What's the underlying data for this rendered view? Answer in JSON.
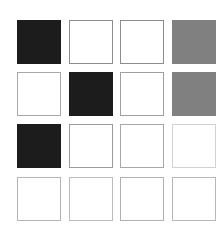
{
  "chart_data": {
    "type": "heatmap",
    "title": "",
    "subtitle": "",
    "xlabel": "",
    "ylabel": "",
    "grid": false,
    "legend": "none",
    "x_tick_labels": [],
    "y_tick_labels": [],
    "columns": 4,
    "rows": 4,
    "value_range": [
      0,
      1
    ],
    "colorscale": {
      "high": "#1c1c1c",
      "mid": "#808080",
      "low": "#ffffff"
    },
    "cells": [
      [
        {
          "value": 1.0,
          "fill": "#1c1c1c",
          "border": "#1c1c1c"
        },
        {
          "value": 0.0,
          "fill": "#ffffff",
          "border": "#8c8c8c"
        },
        {
          "value": 0.0,
          "fill": "#ffffff",
          "border": "#8c8c8c"
        },
        {
          "value": 0.5,
          "fill": "#808080",
          "border": "#808080"
        }
      ],
      [
        {
          "value": 0.0,
          "fill": "#ffffff",
          "border": "#a8a8a8"
        },
        {
          "value": 1.0,
          "fill": "#1c1c1c",
          "border": "#1c1c1c"
        },
        {
          "value": 0.0,
          "fill": "#ffffff",
          "border": "#a0a0a0"
        },
        {
          "value": 0.5,
          "fill": "#808080",
          "border": "#808080"
        }
      ],
      [
        {
          "value": 1.0,
          "fill": "#1c1c1c",
          "border": "#1c1c1c"
        },
        {
          "value": 0.0,
          "fill": "#ffffff",
          "border": "#9a9a9a"
        },
        {
          "value": 0.0,
          "fill": "#ffffff",
          "border": "#a8a8a8"
        },
        {
          "value": 0.0,
          "fill": "#ffffff",
          "border": "#d2d2d2"
        }
      ],
      [
        {
          "value": 0.0,
          "fill": "#ffffff",
          "border": "#b4b4b4"
        },
        {
          "value": 0.0,
          "fill": "#ffffff",
          "border": "#bcbcbc"
        },
        {
          "value": 0.0,
          "fill": "#ffffff",
          "border": "#b0b0b0"
        },
        {
          "value": 0.0,
          "fill": "#ffffff",
          "border": "#b8b8b8"
        }
      ]
    ]
  },
  "canvas": {
    "background": "#ffffff"
  }
}
